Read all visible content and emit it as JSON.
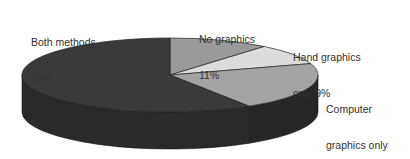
{
  "chart_data": {
    "type": "pie",
    "style": "3d",
    "title": "",
    "categories": [
      "No graphics",
      "Hand graphics only",
      "Computer graphics only",
      "Both methods"
    ],
    "values": [
      11,
      9,
      21,
      59
    ],
    "unit": "%",
    "colors": [
      "#9a9a9a",
      "#dcdcdc",
      "#a4a4a4",
      "#3a3a3a"
    ],
    "side_colors": [
      "#6a6a6a",
      "#9a9a9a",
      "#262626",
      "#2a2a2a"
    ],
    "start_angle_deg": 0,
    "direction": "clockwise",
    "legend": "none",
    "labels": [
      {
        "name": "No graphics",
        "line1": "No graphics",
        "line2": "11%",
        "value": 11
      },
      {
        "name": "Hand graphics only",
        "line1": "Hand graphics",
        "line2": "only 9%",
        "value": 9
      },
      {
        "name": "Computer graphics only",
        "line1": "Computer",
        "line2": "graphics only",
        "line3": "21%",
        "value": 21
      },
      {
        "name": "Both methods",
        "line1": "Both methods",
        "line2": "59%",
        "value": 59
      }
    ]
  },
  "geometry": {
    "cx": 170,
    "cy": 75,
    "rx": 148,
    "ry": 37,
    "depth": 37
  }
}
